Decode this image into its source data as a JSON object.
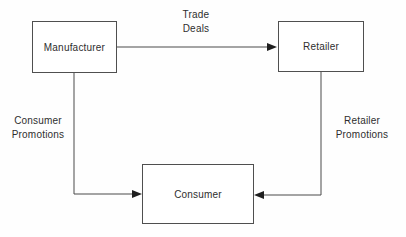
{
  "diagram": {
    "colors": {
      "background": "#fefefe",
      "line": "#4a4a4a",
      "text": "#2e2e2e",
      "box_border": "#4f4f4f"
    },
    "nodes": {
      "manufacturer": {
        "label": "Manufacturer"
      },
      "retailer": {
        "label": "Retailer"
      },
      "consumer": {
        "label": "Consumer"
      }
    },
    "edges": {
      "trade_deals": {
        "from": "Manufacturer",
        "to": "Retailer",
        "line1": "Trade",
        "line2": "Deals"
      },
      "consumer_promotions": {
        "from": "Manufacturer",
        "to": "Consumer",
        "line1": "Consumer",
        "line2": "Promotions"
      },
      "retailer_promotions": {
        "from": "Retailer",
        "to": "Consumer",
        "line1": "Retailer",
        "line2": "Promotions"
      }
    }
  }
}
